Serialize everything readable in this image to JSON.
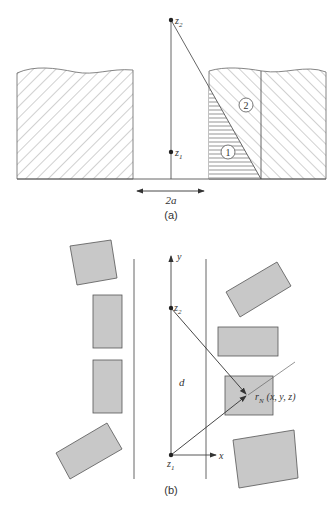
{
  "panel_a": {
    "caption": "(a)",
    "point_top_label": "z",
    "point_top_sub": "2",
    "point_bottom_label": "z",
    "point_bottom_sub": "1",
    "region_1_label": "1",
    "region_2_label": "2",
    "width_label": "2a"
  },
  "panel_b": {
    "caption": "(b)",
    "y_axis_label": "y",
    "x_axis_label": "x",
    "point_top_label": "z",
    "point_top_sub": "2",
    "origin_label": "z",
    "origin_sub": "1",
    "distance_label": "d",
    "target_label_r": "r",
    "target_label_sub": "N",
    "target_label_coords": "(x, y, z)"
  },
  "colors": {
    "line": "#444444",
    "hatch": "#666666",
    "block_fill": "#c8c8c8",
    "block_stroke": "#555555"
  }
}
